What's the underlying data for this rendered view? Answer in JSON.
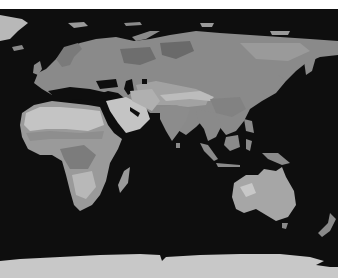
{
  "map": {
    "type": "grayscale world map (eastern hemisphere)",
    "colors": {
      "background": "#ffffff",
      "ocean": "#0e0e0e",
      "land_dark": "#6a6a6a",
      "land_mid": "#8a8a8a",
      "land_light": "#a8a8a8",
      "desert": "#c4c4c4",
      "ice": "#c8c8c8"
    },
    "regions": [
      {
        "name": "Greenland"
      },
      {
        "name": "Europe"
      },
      {
        "name": "Asia"
      },
      {
        "name": "Africa"
      },
      {
        "name": "Arabian Peninsula"
      },
      {
        "name": "India"
      },
      {
        "name": "Southeast Asia"
      },
      {
        "name": "Indonesia"
      },
      {
        "name": "Australia"
      },
      {
        "name": "New Zealand"
      },
      {
        "name": "Madagascar"
      },
      {
        "name": "Japan"
      },
      {
        "name": "Antarctica"
      }
    ]
  }
}
